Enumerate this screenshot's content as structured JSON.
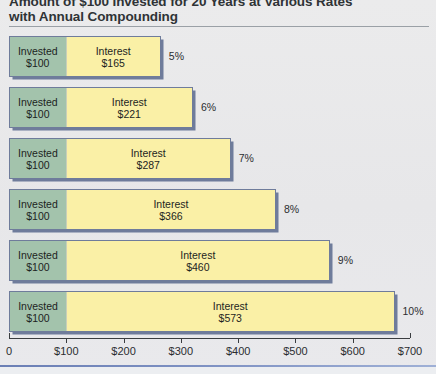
{
  "chart_data": {
    "type": "bar",
    "orientation": "horizontal",
    "stacked": true,
    "title": "Amount of $100 Invested for 20 Years at Various Rates with Annual Compounding",
    "title_line_1": "Amount of $100 Invested for 20 Years at Various Rates",
    "title_line_2": "with Annual Compounding",
    "xlabel": "",
    "ylabel": "",
    "xlim": [
      0,
      700
    ],
    "grid": false,
    "legend": "none",
    "categories": [
      "5%",
      "6%",
      "7%",
      "8%",
      "9%",
      "10%"
    ],
    "series": [
      {
        "name": "Invested",
        "values": [
          100,
          100,
          100,
          100,
          100,
          100
        ],
        "color": "#a3c3ac"
      },
      {
        "name": "Interest",
        "values": [
          165,
          221,
          287,
          366,
          460,
          573
        ],
        "color": "#faf0a6"
      }
    ],
    "totals": [
      265,
      321,
      387,
      466,
      560,
      673
    ],
    "x_ticks": [
      0,
      100,
      200,
      300,
      400,
      500,
      600,
      700
    ],
    "x_tick_labels": [
      "0",
      "$100",
      "$200",
      "$300",
      "$400",
      "$500",
      "$600",
      "$700"
    ],
    "bars": [
      {
        "rate": "5%",
        "invested_label": "Invested",
        "invested_value": "$100",
        "interest_label": "Interest",
        "interest_value": "$165",
        "invested_amount": 100,
        "interest_amount": 165,
        "total": 265
      },
      {
        "rate": "6%",
        "invested_label": "Invested",
        "invested_value": "$100",
        "interest_label": "Interest",
        "interest_value": "$221",
        "invested_amount": 100,
        "interest_amount": 221,
        "total": 321
      },
      {
        "rate": "7%",
        "invested_label": "Invested",
        "invested_value": "$100",
        "interest_label": "Interest",
        "interest_value": "$287",
        "invested_amount": 100,
        "interest_amount": 287,
        "total": 387
      },
      {
        "rate": "8%",
        "invested_label": "Invested",
        "invested_value": "$100",
        "interest_label": "Interest",
        "interest_value": "$366",
        "invested_amount": 100,
        "interest_amount": 366,
        "total": 466
      },
      {
        "rate": "9%",
        "invested_label": "Invested",
        "invested_value": "$100",
        "interest_label": "Interest",
        "interest_value": "$460",
        "invested_amount": 100,
        "interest_amount": 460,
        "total": 560
      },
      {
        "rate": "10%",
        "invested_label": "Invested",
        "invested_value": "$100",
        "interest_label": "Interest",
        "interest_value": "$573",
        "invested_amount": 100,
        "interest_amount": 573,
        "total": 673
      }
    ]
  },
  "colors": {
    "background": "#e9e9ea",
    "invested_fill": "#a3c3ac",
    "interest_fill": "#faf0a6",
    "bar_border": "#6f7c9b",
    "axis": "#3a3d40",
    "title_text": "#2f3336",
    "bottom_rule": "#6b7fb5"
  }
}
